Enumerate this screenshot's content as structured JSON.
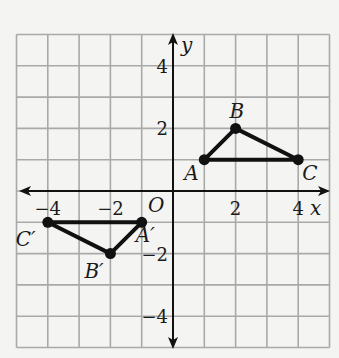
{
  "diagram": {
    "type": "coordinate-plane",
    "grid": {
      "xmin": -5,
      "xmax": 5,
      "ymin": -5,
      "ymax": 5,
      "step": 1
    },
    "axes": {
      "x_label": "x",
      "y_label": "y",
      "origin_label": "O",
      "x_ticks": [
        {
          "value": -4,
          "label": "−4"
        },
        {
          "value": -2,
          "label": "−2"
        },
        {
          "value": 2,
          "label": "2"
        },
        {
          "value": 4,
          "label": "4"
        }
      ],
      "y_ticks": [
        {
          "value": 4,
          "label": "4"
        },
        {
          "value": 2,
          "label": "2"
        },
        {
          "value": -2,
          "label": "−2"
        },
        {
          "value": -4,
          "label": "−4"
        }
      ]
    },
    "triangles": [
      {
        "name": "ABC",
        "points": [
          {
            "label": "A",
            "x": 1,
            "y": 1
          },
          {
            "label": "B",
            "x": 2,
            "y": 2
          },
          {
            "label": "C",
            "x": 4,
            "y": 1
          }
        ]
      },
      {
        "name": "A'B'C'",
        "points": [
          {
            "label": "A′",
            "x": -1,
            "y": -1
          },
          {
            "label": "B′",
            "x": -2,
            "y": -2
          },
          {
            "label": "C′",
            "x": -4,
            "y": -1
          }
        ]
      }
    ]
  }
}
